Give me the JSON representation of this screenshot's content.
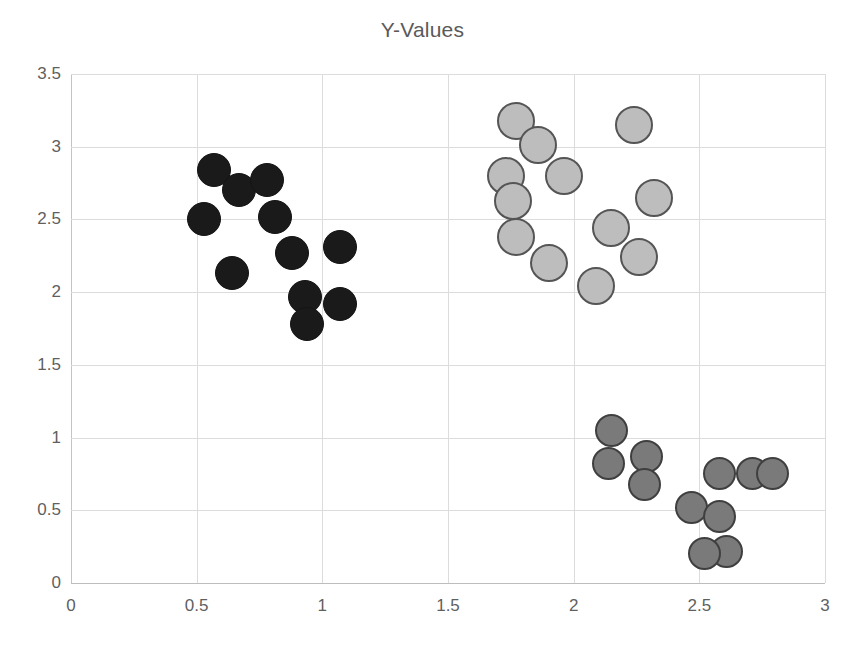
{
  "chart": {
    "title": "Y-Values",
    "x_ticks": [
      "0",
      "0.5",
      "1",
      "1.5",
      "2",
      "2.5",
      "3"
    ],
    "y_ticks": [
      "0",
      "0.5",
      "1",
      "1.5",
      "2",
      "2.5",
      "3",
      "3.5"
    ]
  },
  "chart_data": {
    "type": "scatter",
    "title": "Y-Values",
    "xlabel": "",
    "ylabel": "",
    "xlim": [
      0,
      3
    ],
    "ylim": [
      0,
      3.5
    ],
    "xticks": [
      0,
      0.5,
      1,
      1.5,
      2,
      2.5,
      3
    ],
    "yticks": [
      0,
      0.5,
      1,
      1.5,
      2,
      2.5,
      3,
      3.5
    ],
    "grid": true,
    "legend": "none",
    "series": [
      {
        "name": "Cluster 1 (black)",
        "color": "#1a1a1a",
        "marker": "filled-circle",
        "points": [
          [
            0.57,
            2.84
          ],
          [
            0.53,
            2.5
          ],
          [
            0.67,
            2.7
          ],
          [
            0.78,
            2.77
          ],
          [
            0.81,
            2.52
          ],
          [
            0.64,
            2.13
          ],
          [
            0.88,
            2.27
          ],
          [
            1.07,
            2.31
          ],
          [
            0.93,
            1.97
          ],
          [
            0.94,
            1.78
          ],
          [
            1.07,
            1.92
          ]
        ]
      },
      {
        "name": "Cluster 2 (light gray)",
        "color": "#bdbdbd",
        "marker": "outlined-circle",
        "points": [
          [
            1.77,
            3.18
          ],
          [
            1.86,
            3.01
          ],
          [
            1.96,
            2.8
          ],
          [
            1.73,
            2.8
          ],
          [
            1.76,
            2.63
          ],
          [
            1.77,
            2.38
          ],
          [
            1.9,
            2.2
          ],
          [
            2.24,
            3.15
          ],
          [
            2.32,
            2.65
          ],
          [
            2.15,
            2.44
          ],
          [
            2.26,
            2.24
          ],
          [
            2.09,
            2.04
          ]
        ]
      },
      {
        "name": "Cluster 3 (medium gray)",
        "color": "#7a7a7a",
        "marker": "outlined-circle",
        "points": [
          [
            2.15,
            1.05
          ],
          [
            2.14,
            0.82
          ],
          [
            2.29,
            0.87
          ],
          [
            2.28,
            0.68
          ],
          [
            2.58,
            0.75
          ],
          [
            2.71,
            0.75
          ],
          [
            2.79,
            0.75
          ],
          [
            2.47,
            0.52
          ],
          [
            2.58,
            0.46
          ],
          [
            2.61,
            0.22
          ],
          [
            2.52,
            0.2
          ]
        ]
      }
    ]
  }
}
